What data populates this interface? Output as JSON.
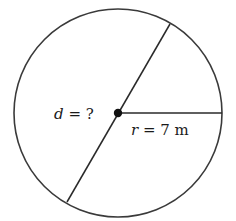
{
  "diagram": {
    "type": "circle-geometry",
    "colors": {
      "stroke": "#3a3a3a",
      "center_dot": "#111111",
      "text": "#1a1a1a",
      "background": "#ffffff"
    },
    "circle": {
      "cx": 118,
      "cy": 113,
      "r": 104
    },
    "center_point": {
      "x": 118,
      "y": 113
    },
    "diameter_line": {
      "x1": 170,
      "y1": 24,
      "x2": 67,
      "y2": 202
    },
    "radius_line": {
      "x1": 118,
      "y1": 113,
      "x2": 222,
      "y2": 113
    },
    "labels": {
      "diameter": {
        "variable": "d",
        "equals": " = ",
        "value": "?"
      },
      "radius": {
        "variable": "r",
        "equals": " = ",
        "value": "7 m"
      }
    }
  }
}
